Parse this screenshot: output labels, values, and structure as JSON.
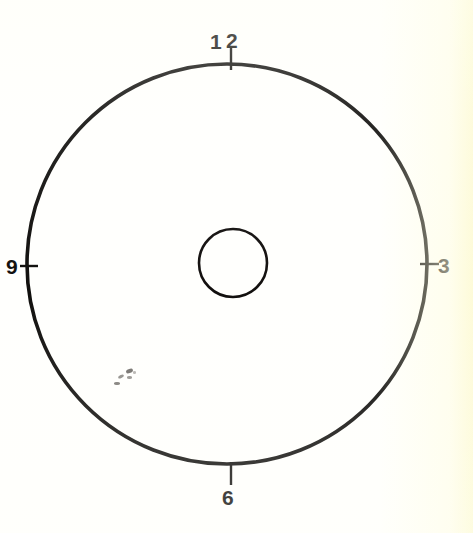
{
  "figure": {
    "name": "clock-face-diagram",
    "background_color": "#fffffd",
    "ink_color": "#100f0d"
  },
  "outer_circle": {
    "name": "clock-rim",
    "center_x": 227,
    "center_y": 264,
    "radius": 200,
    "stroke_width": 3.6,
    "stroke_color": "#100f0d",
    "fill": "none"
  },
  "inner_circle": {
    "name": "center-hub",
    "center_x": 233,
    "center_y": 263,
    "radius": 34,
    "stroke_width": 2.6,
    "stroke_color": "#120f0e",
    "fill": "none"
  },
  "hour_markers": [
    {
      "label": "12",
      "position": "top",
      "label_digits": [
        "1",
        "2"
      ],
      "angle_degrees": 90,
      "tick": {
        "x1": 231,
        "y1": 47,
        "x2": 231,
        "y2": 70,
        "stroke_width": 2.4
      }
    },
    {
      "label": "3",
      "position": "right",
      "angle_degrees": 0,
      "tick": {
        "x1": 420,
        "y1": 264,
        "x2": 439,
        "y2": 264,
        "stroke_width": 2.4
      }
    },
    {
      "label": "6",
      "position": "bottom",
      "angle_degrees": 270,
      "tick": {
        "x1": 231,
        "y1": 462,
        "x2": 231,
        "y2": 485,
        "stroke_width": 2.4
      }
    },
    {
      "label": "9",
      "position": "left",
      "angle_degrees": 180,
      "tick": {
        "x1": 20,
        "y1": 266,
        "x2": 38,
        "y2": 266,
        "stroke_width": 2.4
      }
    }
  ],
  "scan_artifacts": [
    {
      "x": 126,
      "y": 369,
      "w": 7,
      "h": 4,
      "rot": -20,
      "opacity": 0.78
    },
    {
      "x": 118,
      "y": 375,
      "w": 6,
      "h": 3,
      "rot": -25,
      "opacity": 0.62
    },
    {
      "x": 127,
      "y": 376,
      "w": 5,
      "h": 3,
      "rot": 0,
      "opacity": 0.58
    },
    {
      "x": 114,
      "y": 382,
      "w": 6,
      "h": 3,
      "rot": 0,
      "opacity": 0.7
    },
    {
      "x": 133,
      "y": 371,
      "w": 3,
      "h": 3,
      "rot": 0,
      "opacity": 0.4
    }
  ]
}
